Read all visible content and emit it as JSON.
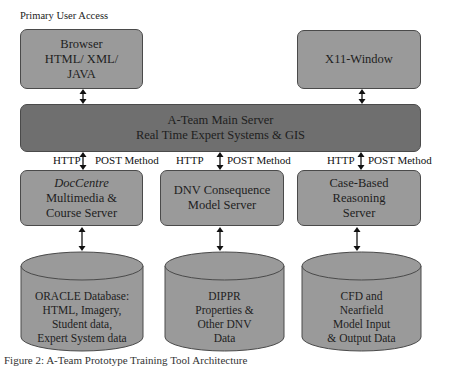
{
  "title": "Primary User Access",
  "top_boxes": {
    "browser": {
      "lines": [
        "Browser",
        "HTML/ XML/",
        "JAVA"
      ]
    },
    "x11": {
      "lines": [
        "X11-Window"
      ]
    }
  },
  "main_server": {
    "lines": [
      "A-Team Main Server",
      "Real Time Expert Systems & GIS"
    ]
  },
  "connections": [
    {
      "left": "HTTP",
      "right": "POST Method"
    },
    {
      "left": "HTTP",
      "right": "POST Method"
    },
    {
      "left": "HTTP",
      "right": "POST Method"
    }
  ],
  "servers": [
    {
      "lines": [
        "DocCentre",
        "Multimedia &",
        "Course Server"
      ],
      "italic_first": true
    },
    {
      "lines": [
        "DNV Consequence",
        "Model Server"
      ]
    },
    {
      "lines": [
        "Case-Based",
        "Reasoning",
        "Server"
      ]
    }
  ],
  "databases": [
    {
      "lines": [
        "ORACLE Database:",
        "HTML, Imagery,",
        "Student data,",
        "Expert System data"
      ]
    },
    {
      "lines": [
        "DIPPR",
        "Properties &",
        "Other DNV",
        "Data"
      ]
    },
    {
      "lines": [
        "CFD and",
        "Nearfield",
        "Model Input",
        "& Output Data"
      ]
    }
  ],
  "caption": "Figure 2: A-Team Prototype Training Tool Architecture",
  "colors": {
    "light_box": "#9a9a9a",
    "dark_box": "#6f6f6f",
    "border": "#4a4a4a"
  }
}
